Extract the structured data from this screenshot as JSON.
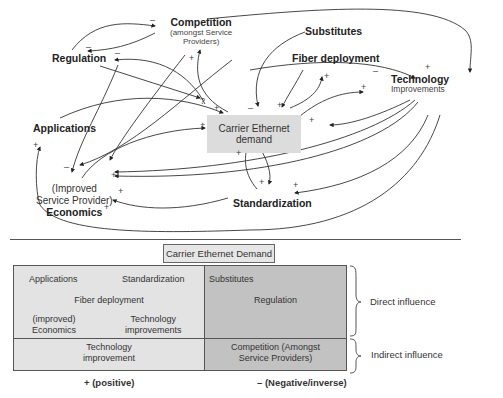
{
  "diagram": {
    "nodes": {
      "competition": {
        "title": "Competition",
        "subtitle_1": "(amongst Service",
        "subtitle_2": "Providers)"
      },
      "regulation": "Regulation",
      "substitutes": "Substitutes",
      "fiber": "Fiber deployment",
      "technology": {
        "title": "Technology",
        "subtitle": "Improvements"
      },
      "applications": "Applications",
      "center": {
        "line1": "Carrier Ethernet",
        "line2": "demand"
      },
      "economics": {
        "line1": "(Improved",
        "line2": "Service Provider)",
        "line3": "Economics"
      },
      "standardization": "Standardization"
    },
    "signs": {
      "plus": "+",
      "minus": "–",
      "question": "?"
    }
  },
  "legend": {
    "title": "Carrier Ethernet Demand",
    "direct": {
      "positive": {
        "applications": "Applications",
        "standardization": "Standardization",
        "fiber": "Fiber deployment",
        "economics_1": "(improved)",
        "economics_2": "Economics",
        "technology_1": "Technology",
        "technology_2": "improvements"
      },
      "negative": {
        "substitutes": "Substitutes",
        "regulation": "Regulation"
      }
    },
    "indirect": {
      "positive_1": "Technology",
      "positive_2": "improvement",
      "negative_1": "Competition (Amongst",
      "negative_2": "Service Providers)"
    },
    "row_labels": {
      "direct": "Direct influence",
      "indirect": "Indirect influence"
    },
    "column_labels": {
      "positive": "+ (positive)",
      "negative": "– (Negative/inverse)"
    },
    "colors": {
      "positive_fill": "#e3e3e3",
      "negative_fill": "#c2c2c2"
    }
  }
}
